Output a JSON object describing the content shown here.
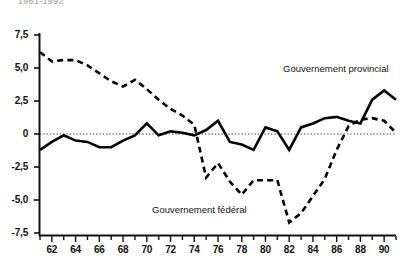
{
  "title_clipped": "1961-1992",
  "axes": {
    "y_ticks": [
      "7,5",
      "5,0",
      "2,5",
      "0",
      "-2,5",
      "-5,0",
      "-7,5"
    ],
    "x_ticks": [
      "62",
      "64",
      "66",
      "68",
      "70",
      "72",
      "74",
      "76",
      "78",
      "80",
      "82",
      "84",
      "86",
      "88",
      "90"
    ]
  },
  "legend": {
    "provincial": "Gouvernement provincial",
    "federal": "Gouvernement fédéral"
  },
  "chart_data": {
    "type": "line",
    "title": "1961-1992",
    "xlabel": "",
    "ylabel": "",
    "xlim": [
      1961,
      1991
    ],
    "ylim": [
      -7.5,
      7.5
    ],
    "yticks": [
      7.5,
      5.0,
      2.5,
      0,
      -2.5,
      -5.0,
      -7.5
    ],
    "ytick_labels": [
      "7,5",
      "5,0",
      "2,5",
      "0",
      "-2,5",
      "-5,0",
      "-7,5"
    ],
    "xticks": [
      1962,
      1964,
      1966,
      1968,
      1970,
      1972,
      1974,
      1976,
      1978,
      1980,
      1982,
      1984,
      1986,
      1988,
      1990
    ],
    "xtick_labels": [
      "62",
      "64",
      "66",
      "68",
      "70",
      "72",
      "74",
      "76",
      "78",
      "80",
      "82",
      "84",
      "86",
      "88",
      "90"
    ],
    "minor_xticks_every": 1,
    "grid": false,
    "zero_line": true,
    "zero_line_style": "dotted",
    "legend_position": "inline-annotation",
    "x": [
      1961,
      1962,
      1963,
      1964,
      1965,
      1966,
      1967,
      1968,
      1969,
      1970,
      1971,
      1972,
      1973,
      1974,
      1975,
      1976,
      1977,
      1978,
      1979,
      1980,
      1981,
      1982,
      1983,
      1984,
      1985,
      1986,
      1987,
      1988,
      1989,
      1990,
      1991
    ],
    "series": [
      {
        "name": "Gouvernement fédéral",
        "style": "dashed",
        "color": "#000000",
        "values": [
          6.2,
          5.5,
          5.6,
          5.6,
          5.2,
          4.6,
          4.0,
          3.6,
          4.1,
          3.4,
          2.6,
          1.9,
          1.4,
          0.7,
          -3.3,
          -2.2,
          -3.6,
          -4.6,
          -3.5,
          -3.5,
          -3.5,
          -6.7,
          -6.0,
          -4.7,
          -3.4,
          -1.2,
          0.6,
          1.1,
          1.2,
          1.0,
          0.1
        ]
      },
      {
        "name": "Gouvernement provincial",
        "style": "solid",
        "color": "#000000",
        "values": [
          -1.2,
          -0.6,
          -0.1,
          -0.5,
          -0.6,
          -1.0,
          -1.0,
          -0.5,
          -0.1,
          0.8,
          -0.1,
          0.2,
          0.1,
          -0.1,
          0.3,
          1.0,
          -0.6,
          -0.8,
          -1.2,
          0.5,
          0.2,
          -1.2,
          0.5,
          0.8,
          1.2,
          1.3,
          1.0,
          0.8,
          2.6,
          3.3,
          2.6
        ]
      }
    ]
  }
}
